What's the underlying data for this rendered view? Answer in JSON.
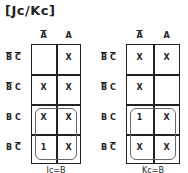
{
  "title": "[Jc/Kc]",
  "column_headers": [
    {
      "var": "A",
      "complemented": true
    },
    {
      "var": "A",
      "complemented": false
    }
  ],
  "row_headers": [
    {
      "terms": [
        {
          "var": "B",
          "complemented": true
        },
        {
          "var": "C",
          "complemented": true
        }
      ]
    },
    {
      "terms": [
        {
          "var": "B",
          "complemented": true
        },
        {
          "var": "C",
          "complemented": false
        }
      ]
    },
    {
      "terms": [
        {
          "var": "B",
          "complemented": false
        },
        {
          "var": "C",
          "complemented": false
        }
      ]
    },
    {
      "terms": [
        {
          "var": "B",
          "complemented": false
        },
        {
          "var": "C",
          "complemented": true
        }
      ]
    }
  ],
  "maps": [
    {
      "name": "Jc",
      "cells": [
        [
          "",
          "X"
        ],
        [
          "X",
          "X"
        ],
        [
          "X",
          "X"
        ],
        [
          "1",
          "X"
        ]
      ],
      "groups": [
        {
          "rows": [
            2,
            3
          ],
          "cols": [
            0,
            1
          ]
        }
      ],
      "result": "Jc=B"
    },
    {
      "name": "Kc",
      "cells": [
        [
          "X",
          "X"
        ],
        [
          "X",
          ""
        ],
        [
          "1",
          "X"
        ],
        [
          "X",
          "X"
        ]
      ],
      "groups": [
        {
          "rows": [
            2,
            3
          ],
          "cols": [
            0,
            1
          ]
        }
      ],
      "result": "Kc=B"
    }
  ]
}
